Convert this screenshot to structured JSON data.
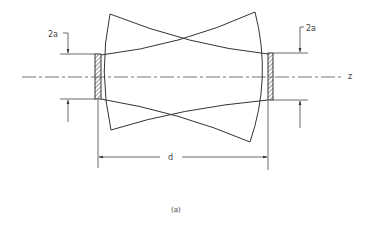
{
  "figure": {
    "caption": "(a)",
    "labels": {
      "aperture_left": "2a",
      "aperture_right": "2a",
      "axis": "z",
      "separation": "d"
    },
    "colors": {
      "line": "#333333",
      "background": "#ffffff"
    }
  }
}
